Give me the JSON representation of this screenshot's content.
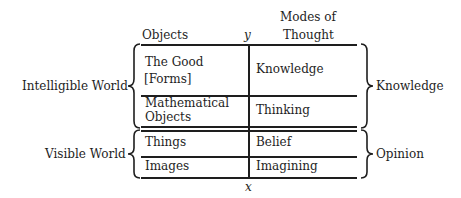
{
  "header": {
    "objects": "Objects",
    "y_axis": "y",
    "modes_line1": "Modes of",
    "modes_line2": "Thought"
  },
  "left_groups": {
    "intelligible": "Intelligible World",
    "visible": "Visible World"
  },
  "right_groups": {
    "knowledge": "Knowledge",
    "opinion": "Opinion"
  },
  "rows": [
    {
      "object_line1": "The Good",
      "object_line2": "[Forms]",
      "mode": "Knowledge"
    },
    {
      "object_line1": "Mathematical",
      "object_line2": "Objects",
      "mode": "Thinking"
    },
    {
      "object_line1": "Things",
      "object_line2": "",
      "mode": "Belief"
    },
    {
      "object_line1": "Images",
      "object_line2": "",
      "mode": "Imagining"
    }
  ],
  "footer": {
    "x_axis": "x"
  }
}
